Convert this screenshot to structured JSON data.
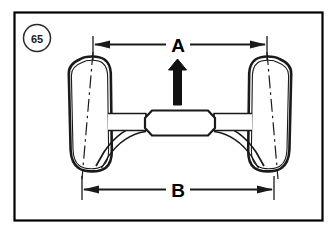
{
  "figure": {
    "number": "65",
    "type": "technical-line-drawing",
    "border_color": "#000000",
    "line_color": "#1a1a1a",
    "background_color": "#ffffff"
  },
  "dimensions": [
    {
      "id": "A",
      "label": "A",
      "position": "top",
      "description": "distance between upper wheel reference points",
      "arrow_style": "double-ended-outward",
      "x_start": 93,
      "x_end": 267,
      "y": 44,
      "span_px": 174
    },
    {
      "id": "B",
      "label": "B",
      "position": "bottom",
      "description": "distance between lower wheel reference points",
      "arrow_style": "double-ended-outward",
      "x_start": 82,
      "x_end": 274,
      "y": 189,
      "span_px": 192
    }
  ],
  "direction_arrow": {
    "name": "forward-direction-arrow",
    "orientation": "up",
    "fill": "#111111"
  },
  "components": [
    {
      "name": "left-wheel",
      "shape": "rounded-rectangle",
      "camber": "top-inward"
    },
    {
      "name": "right-wheel",
      "shape": "rounded-rectangle",
      "camber": "top-inward"
    },
    {
      "name": "differential-housing",
      "shape": "octagonal"
    },
    {
      "name": "left-axle-tube",
      "shape": "tapered-bar"
    },
    {
      "name": "right-axle-tube",
      "shape": "tapered-bar"
    },
    {
      "name": "left-control-arm",
      "shape": "curved-link"
    },
    {
      "name": "right-control-arm",
      "shape": "curved-link"
    },
    {
      "name": "left-wheel-centerline",
      "shape": "dash-dot-line"
    },
    {
      "name": "right-wheel-centerline",
      "shape": "dash-dot-line"
    }
  ]
}
